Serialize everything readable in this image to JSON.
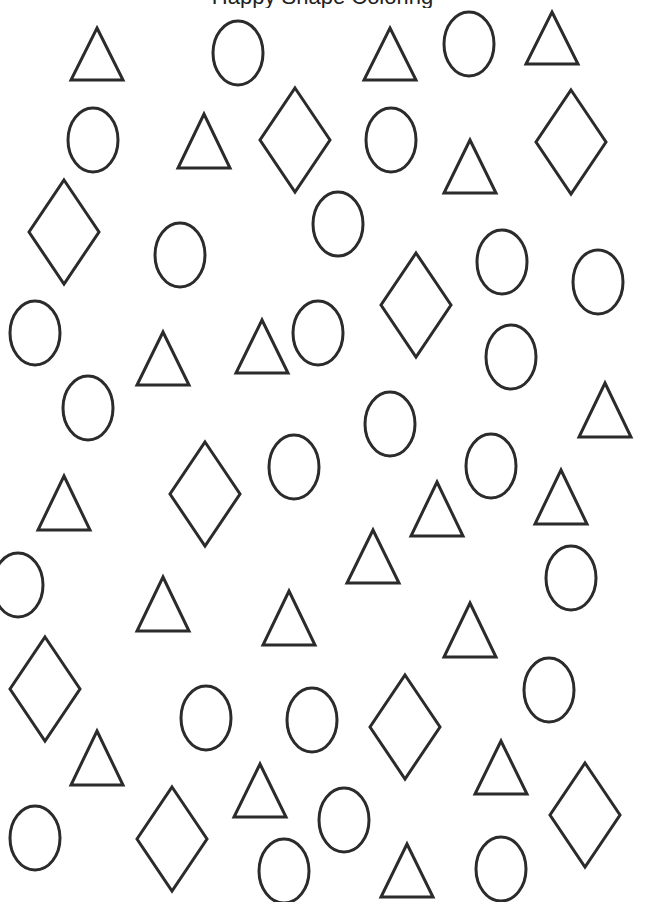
{
  "worksheet": {
    "header_partial": "Happy Shape Coloring",
    "stroke_color": "#2b2b2b",
    "background": "#ffffff"
  },
  "shapes": {
    "triangles": [
      {
        "x": 97,
        "top": 28,
        "bottom": 80
      },
      {
        "x": 390,
        "top": 28,
        "bottom": 80
      },
      {
        "x": 552,
        "top": 12,
        "bottom": 64
      },
      {
        "x": 204,
        "top": 114,
        "bottom": 168
      },
      {
        "x": 470,
        "top": 140,
        "bottom": 193
      },
      {
        "x": 163,
        "top": 332,
        "bottom": 385
      },
      {
        "x": 262,
        "top": 320,
        "bottom": 373
      },
      {
        "x": 605,
        "top": 383,
        "bottom": 437
      },
      {
        "x": 64,
        "top": 476,
        "bottom": 530
      },
      {
        "x": 437,
        "top": 482,
        "bottom": 536
      },
      {
        "x": 561,
        "top": 470,
        "bottom": 524
      },
      {
        "x": 373,
        "top": 530,
        "bottom": 583
      },
      {
        "x": 163,
        "top": 577,
        "bottom": 631
      },
      {
        "x": 289,
        "top": 591,
        "bottom": 645
      },
      {
        "x": 470,
        "top": 603,
        "bottom": 657
      },
      {
        "x": 97,
        "top": 731,
        "bottom": 785
      },
      {
        "x": 260,
        "top": 764,
        "bottom": 817
      },
      {
        "x": 501,
        "top": 741,
        "bottom": 794
      },
      {
        "x": 407,
        "top": 844,
        "bottom": 897
      }
    ],
    "circles": [
      {
        "cx": 238,
        "cy": 53
      },
      {
        "cx": 469,
        "cy": 44
      },
      {
        "cx": 93,
        "cy": 140
      },
      {
        "cx": 391,
        "cy": 140
      },
      {
        "cx": 338,
        "cy": 224
      },
      {
        "cx": 180,
        "cy": 255
      },
      {
        "cx": 502,
        "cy": 262
      },
      {
        "cx": 598,
        "cy": 282
      },
      {
        "cx": 35,
        "cy": 333
      },
      {
        "cx": 318,
        "cy": 333
      },
      {
        "cx": 511,
        "cy": 357
      },
      {
        "cx": 88,
        "cy": 408
      },
      {
        "cx": 390,
        "cy": 424
      },
      {
        "cx": 294,
        "cy": 467
      },
      {
        "cx": 491,
        "cy": 466
      },
      {
        "cx": 18,
        "cy": 585
      },
      {
        "cx": 571,
        "cy": 578
      },
      {
        "cx": 206,
        "cy": 718
      },
      {
        "cx": 312,
        "cy": 720
      },
      {
        "cx": 549,
        "cy": 690
      },
      {
        "cx": 35,
        "cy": 838
      },
      {
        "cx": 284,
        "cy": 871
      },
      {
        "cx": 344,
        "cy": 820
      },
      {
        "cx": 501,
        "cy": 869
      }
    ],
    "diamonds": [
      {
        "cx": 295,
        "cy": 140
      },
      {
        "cx": 571,
        "cy": 142
      },
      {
        "cx": 64,
        "cy": 232
      },
      {
        "cx": 416,
        "cy": 305
      },
      {
        "cx": 205,
        "cy": 494
      },
      {
        "cx": 45,
        "cy": 689
      },
      {
        "cx": 405,
        "cy": 727
      },
      {
        "cx": 172,
        "cy": 839
      },
      {
        "cx": 585,
        "cy": 815
      }
    ]
  },
  "counts": {
    "triangles": 19,
    "circles": 24,
    "diamonds": 9
  }
}
